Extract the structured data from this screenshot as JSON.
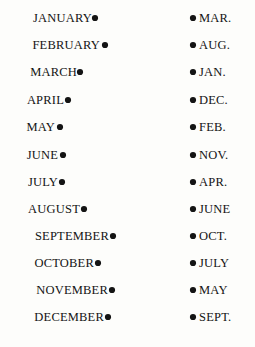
{
  "puzzle": {
    "type": "matching-lines",
    "title": "Month name to abbreviation matching",
    "canvas": {
      "width": 255,
      "height": 347
    },
    "stroke_color": "#141414",
    "background_color": "#fdfdfb",
    "left_column": {
      "name": "month-names",
      "dot_rows_y": [
        18,
        45,
        72,
        100,
        127,
        155,
        182,
        209,
        236,
        263,
        290,
        317
      ],
      "items": [
        {
          "label": "JANUARY",
          "row": 1,
          "dot_x": 95,
          "dot_y": 18,
          "text_right_x": 92
        },
        {
          "label": "FEBRUARY",
          "row": 2,
          "dot_x": 105,
          "dot_y": 45,
          "text_right_x": 100
        },
        {
          "label": "MARCH",
          "row": 3,
          "dot_x": 80,
          "dot_y": 72,
          "text_right_x": 77
        },
        {
          "label": "APRIL",
          "row": 4,
          "dot_x": 68,
          "dot_y": 100,
          "text_right_x": 64
        },
        {
          "label": "MAY",
          "row": 5,
          "dot_x": 60,
          "dot_y": 127,
          "text_right_x": 55
        },
        {
          "label": "JUNE",
          "row": 6,
          "dot_x": 63,
          "dot_y": 155,
          "text_right_x": 58
        },
        {
          "label": "JULY",
          "row": 7,
          "dot_x": 62,
          "dot_y": 182,
          "text_right_x": 58
        },
        {
          "label": "AUGUST",
          "row": 8,
          "dot_x": 84,
          "dot_y": 209,
          "text_right_x": 80
        },
        {
          "label": "SEPTEMBER",
          "row": 9,
          "dot_x": 113,
          "dot_y": 236,
          "text_right_x": 109
        },
        {
          "label": "OCTOBER",
          "row": 10,
          "dot_x": 98,
          "dot_y": 263,
          "text_right_x": 94
        },
        {
          "label": "NOVEMBER",
          "row": 11,
          "dot_x": 112,
          "dot_y": 290,
          "text_right_x": 108
        },
        {
          "label": "DECEMBER",
          "row": 12,
          "dot_x": 108,
          "dot_y": 317,
          "text_right_x": 104
        }
      ]
    },
    "right_column": {
      "name": "month-abbreviations",
      "dot_x": 193,
      "text_left_x": 199,
      "items": [
        {
          "label": "MAR.",
          "row": 1,
          "dot_y": 18
        },
        {
          "label": "AUG.",
          "row": 2,
          "dot_y": 45
        },
        {
          "label": "JAN.",
          "row": 3,
          "dot_y": 72
        },
        {
          "label": "DEC.",
          "row": 4,
          "dot_y": 100
        },
        {
          "label": "FEB.",
          "row": 5,
          "dot_y": 127
        },
        {
          "label": "NOV.",
          "row": 6,
          "dot_y": 155
        },
        {
          "label": "APR.",
          "row": 7,
          "dot_y": 182
        },
        {
          "label": "JUNE",
          "row": 8,
          "dot_y": 209
        },
        {
          "label": "OCT.",
          "row": 9,
          "dot_y": 236
        },
        {
          "label": "JULY",
          "row": 10,
          "dot_y": 263
        },
        {
          "label": "MAY",
          "row": 11,
          "dot_y": 290
        },
        {
          "label": "SEPT.",
          "row": 12,
          "dot_y": 317
        }
      ]
    },
    "connections": [
      {
        "from": "JANUARY",
        "to": "JAN.",
        "from_row": 1,
        "to_row": 3
      },
      {
        "from": "FEBRUARY",
        "to": "FEB.",
        "from_row": 2,
        "to_row": 5
      },
      {
        "from": "MARCH",
        "to": "MAR.",
        "from_row": 3,
        "to_row": 1
      },
      {
        "from": "APRIL",
        "to": "APR.",
        "from_row": 4,
        "to_row": 7
      },
      {
        "from": "MAY",
        "to": "MAY",
        "from_row": 5,
        "to_row": 11
      },
      {
        "from": "JUNE",
        "to": "JUNE",
        "from_row": 6,
        "to_row": 8
      },
      {
        "from": "JULY",
        "to": "JULY",
        "from_row": 7,
        "to_row": 10
      },
      {
        "from": "AUGUST",
        "to": "AUG.",
        "from_row": 8,
        "to_row": 2
      },
      {
        "from": "SEPTEMBER",
        "to": "SEPT.",
        "from_row": 9,
        "to_row": 12
      },
      {
        "from": "OCTOBER",
        "to": "OCT.",
        "from_row": 10,
        "to_row": 9
      },
      {
        "from": "NOVEMBER",
        "to": "NOV.",
        "from_row": 11,
        "to_row": 6
      },
      {
        "from": "DECEMBER",
        "to": "DEC.",
        "from_row": 12,
        "to_row": 4
      }
    ]
  }
}
